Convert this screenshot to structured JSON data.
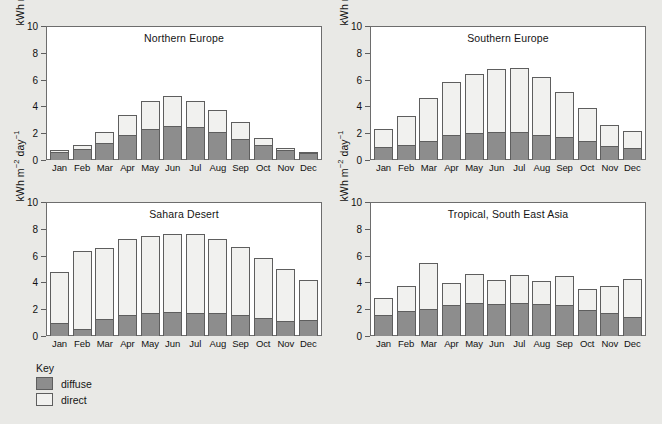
{
  "chart_data": {
    "type": "bar",
    "subtype": "stacked-bar-small-multiples",
    "title": "",
    "xlabel": "",
    "ylabel": "kWh m-2 day-1",
    "ylabel_parts": {
      "pre": "kWh m",
      "sup1": "−2",
      "mid": " day",
      "sup2": "−1"
    },
    "ylim": [
      0,
      10
    ],
    "yticks": [
      0,
      2,
      4,
      6,
      8,
      10
    ],
    "ytick_labels": [
      "0",
      "2",
      "4",
      "6",
      "8",
      "10"
    ],
    "grid": false,
    "categories": [
      "Jan",
      "Feb",
      "Mar",
      "Apr",
      "May",
      "Jun",
      "Jul",
      "Aug",
      "Sep",
      "Oct",
      "Nov",
      "Dec"
    ],
    "legend": {
      "title": "Key",
      "position": "below-left",
      "entries": [
        {
          "name": "diffuse",
          "color": "#8d8d8d"
        },
        {
          "name": "direct",
          "color": "#f1f1ef"
        }
      ]
    },
    "panels": [
      {
        "title": "Northern Europe",
        "series": [
          {
            "name": "diffuse",
            "values": [
              0.6,
              0.85,
              1.3,
              1.9,
              2.3,
              2.55,
              2.45,
              2.1,
              1.6,
              1.15,
              0.75,
              0.5
            ]
          },
          {
            "name": "direct",
            "values": [
              0.15,
              0.3,
              0.8,
              1.45,
              2.1,
              2.2,
              1.95,
              1.6,
              1.2,
              0.5,
              0.15,
              0.1
            ]
          }
        ],
        "totals": [
          0.75,
          1.15,
          2.1,
          3.35,
          4.4,
          4.75,
          4.4,
          3.7,
          2.8,
          1.65,
          0.9,
          0.6
        ]
      },
      {
        "title": "Southern Europe",
        "series": [
          {
            "name": "diffuse",
            "values": [
              0.95,
              1.15,
              1.45,
              1.9,
              2.05,
              2.1,
              2.1,
              1.9,
              1.7,
              1.4,
              1.05,
              0.9
            ]
          },
          {
            "name": "direct",
            "values": [
              1.4,
              2.15,
              3.15,
              3.95,
              4.35,
              4.7,
              4.75,
              4.3,
              3.35,
              2.45,
              1.6,
              1.3
            ]
          }
        ],
        "totals": [
          2.35,
          3.3,
          4.6,
          5.85,
          6.4,
          6.8,
          6.85,
          6.2,
          5.05,
          3.85,
          2.65,
          2.2
        ]
      },
      {
        "title": "Sahara Desert",
        "series": [
          {
            "name": "diffuse",
            "values": [
              0.95,
              0.55,
              1.3,
              1.55,
              1.75,
              1.8,
              1.75,
              1.75,
              1.6,
              1.35,
              1.1,
              1.2
            ]
          },
          {
            "name": "direct",
            "values": [
              3.8,
              5.8,
              5.3,
              5.7,
              5.75,
              5.8,
              5.9,
              5.5,
              5.05,
              4.5,
              3.9,
              2.95
            ]
          }
        ],
        "totals": [
          4.75,
          6.35,
          6.6,
          7.25,
          7.5,
          7.6,
          7.65,
          7.25,
          6.65,
          5.85,
          5.0,
          4.15
        ]
      },
      {
        "title": "Tropical, South East Asia",
        "series": [
          {
            "name": "diffuse",
            "values": [
              1.6,
              1.9,
              2.0,
              2.35,
              2.45,
              2.4,
              2.45,
              2.4,
              2.3,
              1.95,
              1.75,
              1.4
            ]
          },
          {
            "name": "direct",
            "values": [
              1.25,
              1.8,
              3.45,
              1.6,
              2.15,
              1.75,
              2.1,
              1.7,
              2.15,
              1.55,
              1.95,
              2.85
            ]
          }
        ],
        "totals": [
          2.85,
          3.7,
          5.45,
          3.95,
          4.6,
          4.15,
          4.55,
          4.1,
          4.45,
          3.5,
          3.7,
          4.25
        ]
      }
    ]
  }
}
